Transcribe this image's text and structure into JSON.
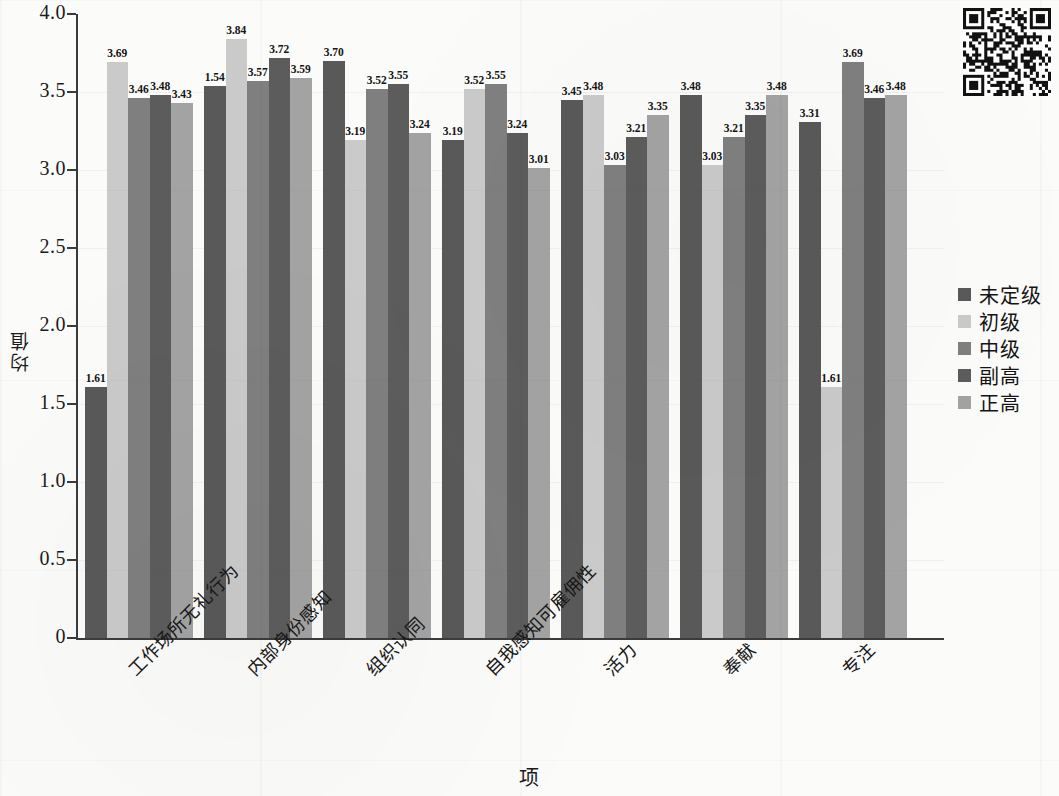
{
  "chart_data": {
    "type": "bar",
    "title": "",
    "xlabel": "项",
    "ylabel": "均值",
    "ylim": [
      0,
      4.0
    ],
    "ytick_labels": [
      "0",
      "0.5",
      "1.0",
      "1.5",
      "2.0",
      "2.5",
      "3.0",
      "3.5",
      "4.0"
    ],
    "ytick_values": [
      0,
      0.5,
      1.0,
      1.5,
      2.0,
      2.5,
      3.0,
      3.5,
      4.0
    ],
    "grid": true,
    "legend_position": "right",
    "categories": [
      "工作场所无礼行为",
      "内部身份感知",
      "组织认同",
      "自我感知可雇佣性",
      "活力",
      "奉献",
      "专注"
    ],
    "series": [
      {
        "name": "未定级",
        "color": "#595959",
        "values": [
          1.61,
          3.54,
          3.7,
          3.19,
          3.45,
          3.48,
          3.31
        ],
        "labels": [
          "1.61",
          "1.54",
          "3.70",
          "3.19",
          "3.45",
          "3.48",
          "3.31"
        ]
      },
      {
        "name": "初级",
        "color": "#cacaca",
        "values": [
          3.69,
          3.84,
          3.19,
          3.52,
          3.48,
          3.03,
          1.61
        ],
        "labels": [
          "3.69",
          "3.84",
          "3.19",
          "3.52",
          "3.48",
          "3.03",
          "1.61"
        ]
      },
      {
        "name": "中级",
        "color": "#7f7f7f",
        "values": [
          3.46,
          3.57,
          3.52,
          3.55,
          3.03,
          3.21,
          3.69
        ],
        "labels": [
          "3.46",
          "3.57",
          "3.52",
          "3.55",
          "3.03",
          "3.21",
          "3.69"
        ]
      },
      {
        "name": "副高",
        "color": "#5c5c5c",
        "values": [
          3.48,
          3.72,
          3.55,
          3.24,
          3.21,
          3.35,
          3.46
        ],
        "labels": [
          "3.48",
          "3.72",
          "3.55",
          "3.24",
          "3.21",
          "3.35",
          "3.46"
        ]
      },
      {
        "name": "正高",
        "color": "#a3a3a3",
        "values": [
          3.43,
          3.59,
          3.24,
          3.01,
          3.35,
          3.48,
          3.48
        ],
        "labels": [
          "3.43",
          "3.59",
          "3.24",
          "3.01",
          "3.35",
          "3.48",
          "3.48"
        ]
      }
    ]
  },
  "legend": {
    "items": [
      {
        "label": "未定级",
        "color": "#595959"
      },
      {
        "label": "初级",
        "color": "#cacaca"
      },
      {
        "label": "中级",
        "color": "#7f7f7f"
      },
      {
        "label": "副高",
        "color": "#5c5c5c"
      },
      {
        "label": "正高",
        "color": "#a3a3a3"
      }
    ]
  },
  "page": {
    "qr_code_present": true,
    "axis_color": "#3b3b3b",
    "background": "#fbfbfa"
  }
}
